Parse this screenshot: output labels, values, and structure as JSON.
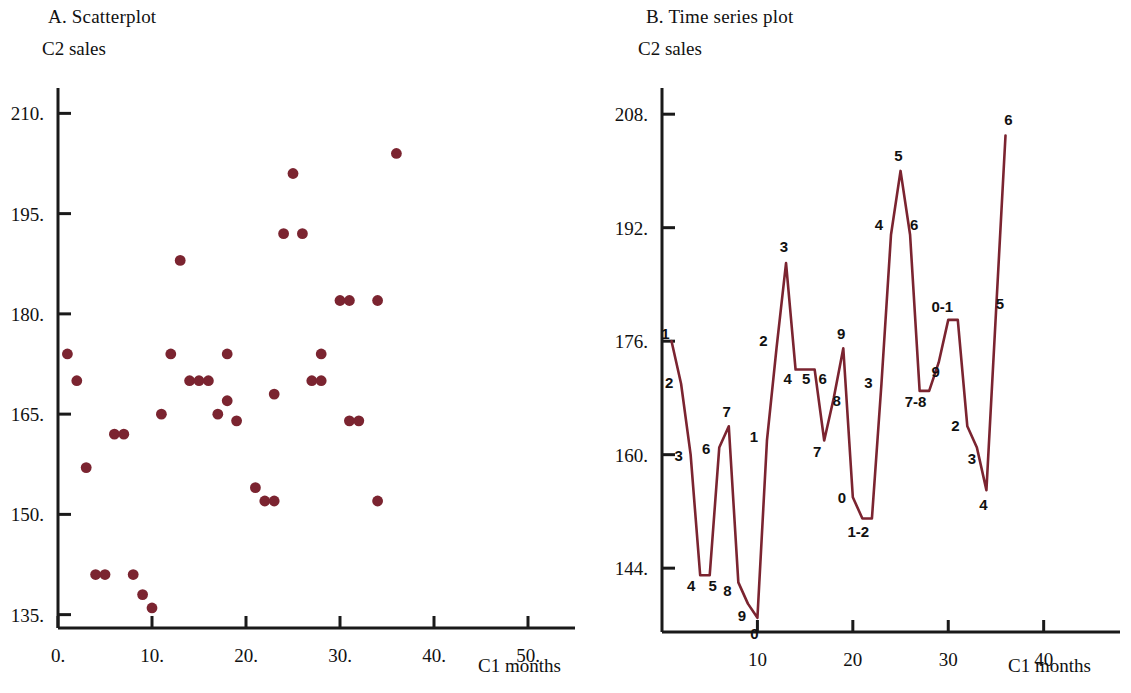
{
  "figure": {
    "background_color": "#ffffff",
    "axis_color": "#1a1a1a",
    "data_color": "#7B2430"
  },
  "panel_a": {
    "title": "A. Scatterplot",
    "y_axis_name": "C2 sales",
    "x_axis_name": "C1 months"
  },
  "panel_b": {
    "title": "B. Time series plot",
    "y_axis_name": "C2  sales",
    "x_axis_name": "C1 months"
  },
  "chart_data": [
    {
      "type": "scatter",
      "title": "A. Scatterplot",
      "xlabel": "C1 months",
      "ylabel": "C2 sales",
      "xlim": [
        0,
        55
      ],
      "ylim": [
        133,
        212
      ],
      "grid": false,
      "legend": "none",
      "marker_color": "#7B2430",
      "xticks": [
        0,
        10,
        20,
        30,
        40,
        50
      ],
      "xticklabels": [
        "0.",
        "10.",
        "20.",
        "30.",
        "40.",
        "50."
      ],
      "yticks": [
        135,
        150,
        165,
        180,
        195,
        210
      ],
      "yticklabels": [
        "135.",
        "150.",
        "165.",
        "180.",
        "195.",
        "210."
      ],
      "points": [
        {
          "x": 1,
          "y": 174
        },
        {
          "x": 2,
          "y": 170
        },
        {
          "x": 3,
          "y": 157
        },
        {
          "x": 4,
          "y": 141
        },
        {
          "x": 5,
          "y": 141
        },
        {
          "x": 6,
          "y": 162
        },
        {
          "x": 7,
          "y": 162
        },
        {
          "x": 8,
          "y": 141
        },
        {
          "x": 9,
          "y": 138
        },
        {
          "x": 10,
          "y": 136
        },
        {
          "x": 11,
          "y": 165
        },
        {
          "x": 12,
          "y": 174
        },
        {
          "x": 13,
          "y": 188
        },
        {
          "x": 14,
          "y": 170
        },
        {
          "x": 15,
          "y": 170
        },
        {
          "x": 16,
          "y": 170
        },
        {
          "x": 17,
          "y": 165
        },
        {
          "x": 18,
          "y": 167
        },
        {
          "x": 18,
          "y": 174
        },
        {
          "x": 19,
          "y": 164
        },
        {
          "x": 21,
          "y": 154
        },
        {
          "x": 22,
          "y": 152
        },
        {
          "x": 23,
          "y": 152
        },
        {
          "x": 23,
          "y": 168
        },
        {
          "x": 24,
          "y": 192
        },
        {
          "x": 25,
          "y": 201
        },
        {
          "x": 26,
          "y": 192
        },
        {
          "x": 27,
          "y": 170
        },
        {
          "x": 28,
          "y": 170
        },
        {
          "x": 28,
          "y": 174
        },
        {
          "x": 30,
          "y": 182
        },
        {
          "x": 31,
          "y": 182
        },
        {
          "x": 31,
          "y": 164
        },
        {
          "x": 32,
          "y": 164
        },
        {
          "x": 34,
          "y": 152
        },
        {
          "x": 34,
          "y": 182
        },
        {
          "x": 36,
          "y": 204
        }
      ]
    },
    {
      "type": "line",
      "title": "B. Time series plot",
      "xlabel": "C1 months",
      "ylabel": "C2  sales",
      "xlim": [
        0,
        48
      ],
      "ylim": [
        135,
        210
      ],
      "grid": false,
      "legend": "none",
      "line_color": "#7B2430",
      "xticks": [
        10,
        20,
        30,
        40
      ],
      "xticklabels": [
        "10",
        "20",
        "30",
        "40"
      ],
      "yticks": [
        144,
        160,
        176,
        192,
        208
      ],
      "yticklabels": [
        "144.",
        "160.",
        "176.",
        "192.",
        "208."
      ],
      "points": [
        {
          "x": 1,
          "y": 176,
          "label": "1",
          "lx": -6,
          "ly": -2
        },
        {
          "x": 2,
          "y": 170,
          "label": "2",
          "lx": -12,
          "ly": 4
        },
        {
          "x": 3,
          "y": 160,
          "label": "3",
          "lx": -12,
          "ly": 6
        },
        {
          "x": 4,
          "y": 143,
          "label": "4",
          "lx": -9,
          "ly": 16
        },
        {
          "x": 5,
          "y": 143,
          "label": "5",
          "lx": 3,
          "ly": 16
        },
        {
          "x": 6,
          "y": 161,
          "label": "6",
          "lx": -13,
          "ly": 6
        },
        {
          "x": 7,
          "y": 164,
          "label": "7",
          "lx": -2,
          "ly": -9
        },
        {
          "x": 8,
          "y": 142,
          "label": "8",
          "lx": -11,
          "ly": 14
        },
        {
          "x": 9,
          "y": 139,
          "label": "9",
          "lx": -6,
          "ly": 17
        },
        {
          "x": 10,
          "y": 137,
          "label": "0",
          "lx": -3,
          "ly": 21
        },
        {
          "x": 11,
          "y": 162,
          "label": "1",
          "lx": -13,
          "ly": 2
        },
        {
          "x": 12,
          "y": 175,
          "label": "2",
          "lx": -13,
          "ly": -2
        },
        {
          "x": 13,
          "y": 187,
          "label": "3",
          "lx": -2,
          "ly": -11
        },
        {
          "x": 14,
          "y": 172,
          "label": "4",
          "lx": -8,
          "ly": 14
        },
        {
          "x": 15,
          "y": 172,
          "label": "5",
          "lx": 1,
          "ly": 14
        },
        {
          "x": 16,
          "y": 172,
          "label": "6",
          "lx": 8,
          "ly": 14
        },
        {
          "x": 17,
          "y": 162,
          "label": "7",
          "lx": -7,
          "ly": 17
        },
        {
          "x": 18,
          "y": 168,
          "label": "8",
          "lx": 3,
          "ly": 8
        },
        {
          "x": 19,
          "y": 175,
          "label": "9",
          "lx": -2,
          "ly": -9
        },
        {
          "x": 20,
          "y": 154,
          "label": "0",
          "lx": -11,
          "ly": 6
        },
        {
          "x": 21,
          "y": 151,
          "label": "1-2",
          "lx": -4,
          "ly": 18
        },
        {
          "x": 22,
          "y": 151,
          "label": "",
          "lx": 0,
          "ly": 0
        },
        {
          "x": 23,
          "y": 170,
          "label": "3",
          "lx": -13,
          "ly": 4
        },
        {
          "x": 24,
          "y": 191,
          "label": "4",
          "lx": -12,
          "ly": -5
        },
        {
          "x": 25,
          "y": 200,
          "label": "5",
          "lx": -2,
          "ly": -10
        },
        {
          "x": 26,
          "y": 191,
          "label": "6",
          "lx": 4,
          "ly": -5
        },
        {
          "x": 27,
          "y": 169,
          "label": "7-8",
          "lx": -4,
          "ly": 16
        },
        {
          "x": 28,
          "y": 169,
          "label": "",
          "lx": 0,
          "ly": 0
        },
        {
          "x": 29,
          "y": 173,
          "label": "9",
          "lx": -3,
          "ly": 15
        },
        {
          "x": 30,
          "y": 179,
          "label": "0-1",
          "lx": -6,
          "ly": -8
        },
        {
          "x": 31,
          "y": 179,
          "label": "",
          "lx": 0,
          "ly": 0
        },
        {
          "x": 32,
          "y": 164,
          "label": "2",
          "lx": -12,
          "ly": 5
        },
        {
          "x": 33,
          "y": 161,
          "label": "3",
          "lx": -5,
          "ly": 16
        },
        {
          "x": 34,
          "y": 155,
          "label": "4",
          "lx": -3,
          "ly": 20
        },
        {
          "x": 35,
          "y": 180,
          "label": "5",
          "lx": 4,
          "ly": -4
        },
        {
          "x": 36,
          "y": 205,
          "label": "6",
          "lx": 3,
          "ly": -10
        }
      ]
    }
  ]
}
